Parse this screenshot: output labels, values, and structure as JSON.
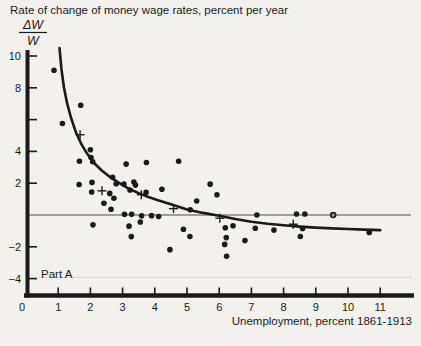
{
  "chart_data": {
    "type": "scatter",
    "title": "Rate of change of money wage rates, percent per year",
    "ylabel_fraction": {
      "numerator": "ΔW",
      "denominator": "W"
    },
    "xlabel": "Unemployment, percent 1861-1913",
    "part_label": "Part A",
    "xlim": [
      0,
      12
    ],
    "ylim": [
      -5,
      10.6
    ],
    "grid": false,
    "legend": "none",
    "zero_line_at_y": 0,
    "x_ticks": [
      {
        "value": 0,
        "label": "0"
      },
      {
        "value": 1,
        "label": "1"
      },
      {
        "value": 2,
        "label": "2"
      },
      {
        "value": 3,
        "label": "3"
      },
      {
        "value": 4,
        "label": "4"
      },
      {
        "value": 5,
        "label": "5"
      },
      {
        "value": 6,
        "label": "6"
      },
      {
        "value": 7,
        "label": "7"
      },
      {
        "value": 8,
        "label": "8"
      },
      {
        "value": 9,
        "label": "9"
      },
      {
        "value": 10,
        "label": "10"
      },
      {
        "value": 11,
        "label": "11"
      }
    ],
    "y_ticks": [
      {
        "value": 10,
        "label": "10"
      },
      {
        "value": 8,
        "label": "8"
      },
      {
        "value": 6,
        "label": ""
      },
      {
        "value": 4,
        "label": "4"
      },
      {
        "value": 2,
        "label": "2"
      },
      {
        "value": -2,
        "label": "−2"
      },
      {
        "value": -4,
        "label": "−4"
      }
    ],
    "dots": [
      [
        0.87,
        9.1
      ],
      [
        1.13,
        5.75
      ],
      [
        1.7,
        6.9
      ],
      [
        2.0,
        4.1
      ],
      [
        2.02,
        3.62
      ],
      [
        1.66,
        3.38
      ],
      [
        2.07,
        3.35
      ],
      [
        3.11,
        3.2
      ],
      [
        3.74,
        3.3
      ],
      [
        4.74,
        3.38
      ],
      [
        1.65,
        1.92
      ],
      [
        2.05,
        2.05
      ],
      [
        2.04,
        1.45
      ],
      [
        2.42,
        0.74
      ],
      [
        2.6,
        1.36
      ],
      [
        2.64,
        0.36
      ],
      [
        2.69,
        2.37
      ],
      [
        2.8,
        1.97
      ],
      [
        2.73,
        1.05
      ],
      [
        3.04,
        1.95
      ],
      [
        3.23,
        1.57
      ],
      [
        3.35,
        2.07
      ],
      [
        3.4,
        1.88
      ],
      [
        3.73,
        1.42
      ],
      [
        4.22,
        1.62
      ],
      [
        3.06,
        0.05
      ],
      [
        3.28,
        0.04
      ],
      [
        3.59,
        -0.05
      ],
      [
        3.9,
        -0.04
      ],
      [
        4.12,
        -0.1
      ],
      [
        2.08,
        -0.62
      ],
      [
        3.2,
        -0.7
      ],
      [
        3.27,
        -1.36
      ],
      [
        3.55,
        -0.44
      ],
      [
        4.47,
        -2.18
      ],
      [
        4.89,
        -0.9
      ],
      [
        5.09,
        -1.35
      ],
      [
        5.3,
        0.88
      ],
      [
        5.1,
        0.33
      ],
      [
        5.72,
        1.94
      ],
      [
        5.93,
        1.27
      ],
      [
        6.19,
        -0.8
      ],
      [
        6.43,
        -0.68
      ],
      [
        6.22,
        -1.42
      ],
      [
        6.17,
        -1.85
      ],
      [
        6.23,
        -2.6
      ],
      [
        6.8,
        -1.6
      ],
      [
        7.12,
        -0.83
      ],
      [
        7.17,
        0.0
      ],
      [
        7.7,
        -0.95
      ],
      [
        8.4,
        0.06
      ],
      [
        8.66,
        0.06
      ],
      [
        8.59,
        -0.85
      ],
      [
        8.52,
        -1.35
      ],
      [
        10.66,
        -1.1
      ]
    ],
    "open_circle": [
      9.54,
      0.0
    ],
    "crosses": [
      [
        1.68,
        5.05
      ],
      [
        2.36,
        1.52
      ],
      [
        3.58,
        1.28
      ],
      [
        4.58,
        0.4
      ],
      [
        6.02,
        -0.2
      ],
      [
        8.3,
        -0.58
      ]
    ],
    "curve": [
      [
        1.04,
        10.5
      ],
      [
        1.1,
        9.2
      ],
      [
        1.18,
        8.0
      ],
      [
        1.28,
        7.0
      ],
      [
        1.4,
        6.1
      ],
      [
        1.55,
        5.2
      ],
      [
        1.72,
        4.45
      ],
      [
        1.9,
        3.85
      ],
      [
        2.1,
        3.3
      ],
      [
        2.35,
        2.8
      ],
      [
        2.6,
        2.4
      ],
      [
        2.9,
        2.0
      ],
      [
        3.2,
        1.65
      ],
      [
        3.5,
        1.38
      ],
      [
        3.8,
        1.13
      ],
      [
        4.1,
        0.93
      ],
      [
        4.5,
        0.68
      ],
      [
        5.0,
        0.35
      ],
      [
        5.5,
        0.13
      ],
      [
        6.0,
        -0.05
      ],
      [
        6.5,
        -0.25
      ],
      [
        7.0,
        -0.42
      ],
      [
        7.5,
        -0.55
      ],
      [
        8.0,
        -0.65
      ],
      [
        8.5,
        -0.73
      ],
      [
        9.0,
        -0.79
      ],
      [
        9.5,
        -0.84
      ],
      [
        10.0,
        -0.88
      ],
      [
        10.5,
        -0.92
      ],
      [
        11.0,
        -0.95
      ]
    ],
    "colors": {
      "ink": "#1a1a1a",
      "background": "#f2f1ee",
      "zero_line": "#4d4d4d"
    }
  }
}
